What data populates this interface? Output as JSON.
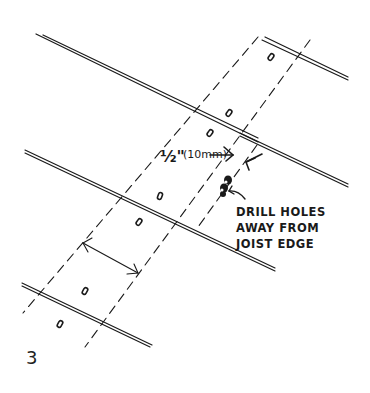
{
  "figure": {
    "number": "3",
    "type": "technical sketch"
  },
  "labels": {
    "dimension": "1/2\" (10mm)",
    "dimension_fraction": "½\"",
    "dimension_metric": "(10mm)",
    "note_line1": "DRILL HOLES",
    "note_line2": "AWAY FROM",
    "note_line3": "JOIST EDGE"
  },
  "colors": {
    "ink": "#1a1a1a",
    "background": "#ffffff"
  }
}
